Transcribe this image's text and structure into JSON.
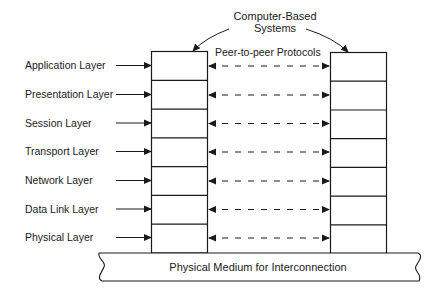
{
  "diagram": {
    "title_line1": "Computer-Based",
    "title_line2": "Systems",
    "protocol_label": "Peer-to-peer Protocols",
    "medium_label": "Physical Medium for Interconnection",
    "layers": [
      {
        "label": "Application Layer"
      },
      {
        "label": "Presentation Layer"
      },
      {
        "label": "Session Layer"
      },
      {
        "label": "Transport Layer"
      },
      {
        "label": "Network Layer"
      },
      {
        "label": "Data Link Layer"
      },
      {
        "label": "Physical Layer"
      }
    ],
    "colors": {
      "stroke": "#1a1a1a",
      "background": "#ffffff"
    }
  }
}
